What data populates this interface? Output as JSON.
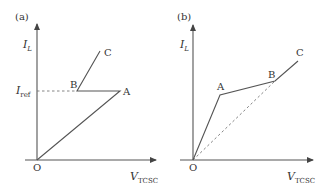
{
  "panels": [
    {
      "id": "a",
      "panel_label": "(a)",
      "y_axis_label": "I",
      "y_axis_sub": "L",
      "x_axis_label": "V",
      "x_axis_sub": "TCSC",
      "origin_label": "O",
      "ref_label": "I",
      "ref_sub": "ref",
      "points": {
        "A": "A",
        "B": "B",
        "C": "C"
      }
    },
    {
      "id": "b",
      "panel_label": "(b)",
      "y_axis_label": "I",
      "y_axis_sub": "L",
      "x_axis_label": "V",
      "x_axis_sub": "TCSC",
      "origin_label": "O",
      "points": {
        "A": "A",
        "B": "B",
        "C": "C"
      }
    }
  ],
  "colors": {
    "line": "#555555",
    "dashed": "#777777",
    "text": "#333333"
  }
}
